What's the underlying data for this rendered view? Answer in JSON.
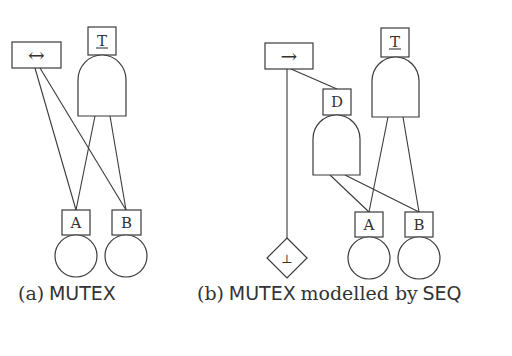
{
  "figure_a": {
    "caption": {
      "tag": "(a)",
      "name": "MUTEX"
    },
    "nodes": {
      "mutex_gate": {
        "symbol": "↔"
      },
      "top_event": {
        "label": "T"
      },
      "event_a": {
        "label": "A"
      },
      "event_b": {
        "label": "B"
      }
    }
  },
  "figure_b": {
    "caption": {
      "tag": "(b)",
      "name": "MUTEX",
      "middle": "modelled by",
      "via": "SEQ"
    },
    "nodes": {
      "seq_gate": {
        "symbol": "→"
      },
      "dummy_event": {
        "label": "D"
      },
      "top_event": {
        "label": "T"
      },
      "never_event": {
        "symbol": "⊥"
      },
      "event_a": {
        "label": "A"
      },
      "event_b": {
        "label": "B"
      }
    }
  }
}
